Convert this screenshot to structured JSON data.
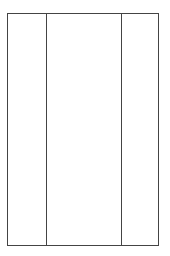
{
  "diagram": {
    "type": "three-column-panel",
    "stroke_color": "#444444",
    "background": "#ffffff",
    "columns": [
      {
        "name": "left",
        "label": ""
      },
      {
        "name": "center",
        "label": ""
      },
      {
        "name": "right",
        "label": ""
      }
    ]
  }
}
